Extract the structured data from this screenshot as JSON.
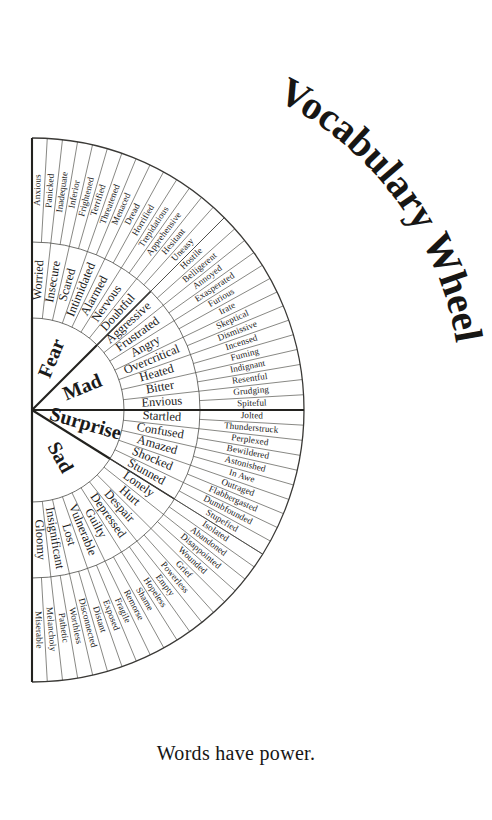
{
  "title": "Vocabulary Wheel",
  "tagline": "Words have power.",
  "colors": {
    "ink": "#1a1a1a",
    "line": "#4a4a46",
    "bold_line": "#23221f",
    "background": "#ffffff"
  },
  "geometry": {
    "center_x": 32,
    "center_y": 410,
    "core_radius": 92,
    "mid_radius": 168,
    "outer_radius": 272,
    "start_angle_deg": -90,
    "end_angle_deg": 90
  },
  "chart_data": {
    "type": "pie",
    "title": "Vocabulary Wheel",
    "subtitle": "Words have power.",
    "legend": "none",
    "note": "Half-wheel (semicircle) emotion vocabulary chart with three concentric rings; inner ring = 4 core emotions, middle ring = intensity words, outer ring = nuanced synonyms.",
    "categories": [
      "Fear",
      "Mad",
      "Surprise",
      "Sad"
    ],
    "values": [
      14,
      14,
      10,
      18
    ],
    "xlabel": "",
    "ylabel": "",
    "series": [
      {
        "name": "core",
        "values": [
          1,
          1,
          1,
          1
        ]
      },
      {
        "name": "middle",
        "values": [
          7,
          7,
          5,
          9
        ]
      },
      {
        "name": "outer",
        "values": [
          14,
          14,
          10,
          18
        ]
      }
    ]
  },
  "wheel": {
    "sectors": [
      {
        "core": "Fear",
        "core_span_deg": 45,
        "middle": [
          "Worried",
          "Insecure",
          "Scared",
          "Intimidated",
          "Alarmed",
          "Nervous",
          "Doubtful"
        ],
        "outer": [
          "Anxious",
          "Panicked",
          "Inadequate",
          "Inferior",
          "Frightened",
          "Terrified",
          "Threatened",
          "Menaced",
          "Dread",
          "Horrified",
          "Trepidatious",
          "Apprehensive",
          "Hesitant",
          "Uneasy"
        ]
      },
      {
        "core": "Mad",
        "core_span_deg": 45,
        "middle": [
          "Aggressive",
          "Frustrated",
          "Angry",
          "Overcritical",
          "Heated",
          "Bitter",
          "Envious"
        ],
        "outer": [
          "Hostile",
          "Belligerent",
          "Annoyed",
          "Exasperated",
          "Furious",
          "Irate",
          "Skeptical",
          "Dismissive",
          "Incensed",
          "Fuming",
          "Indignant",
          "Resentful",
          "Grudging",
          "Spiteful"
        ]
      },
      {
        "core": "Surprise",
        "core_span_deg": 32,
        "middle": [
          "Startled",
          "Confused",
          "Amazed",
          "Shocked",
          "Stunned"
        ],
        "outer": [
          "Jolted",
          "Thunderstruck",
          "Perplexed",
          "Bewildered",
          "Astonished",
          "In Awe",
          "Outraged",
          "Flabbergasted",
          "Dumbfounded",
          "Stupefied"
        ]
      },
      {
        "core": "Sad",
        "core_span_deg": 58,
        "middle": [
          "Lonely",
          "Hurt",
          "Despair",
          "Depressed",
          "Guilty",
          "Vulnerable",
          "Lost",
          "Insignificant",
          "Gloomy"
        ],
        "outer": [
          "Isolated",
          "Abandoned",
          "Disappointed",
          "Wounded",
          "Grief",
          "Powerless",
          "Empty",
          "Hopeless",
          "Shame",
          "Remorse",
          "Fragile",
          "Exposed",
          "Distant",
          "Disconnected",
          "Worthless",
          "Pathetic",
          "Melancholy",
          "Miserable"
        ]
      }
    ]
  }
}
